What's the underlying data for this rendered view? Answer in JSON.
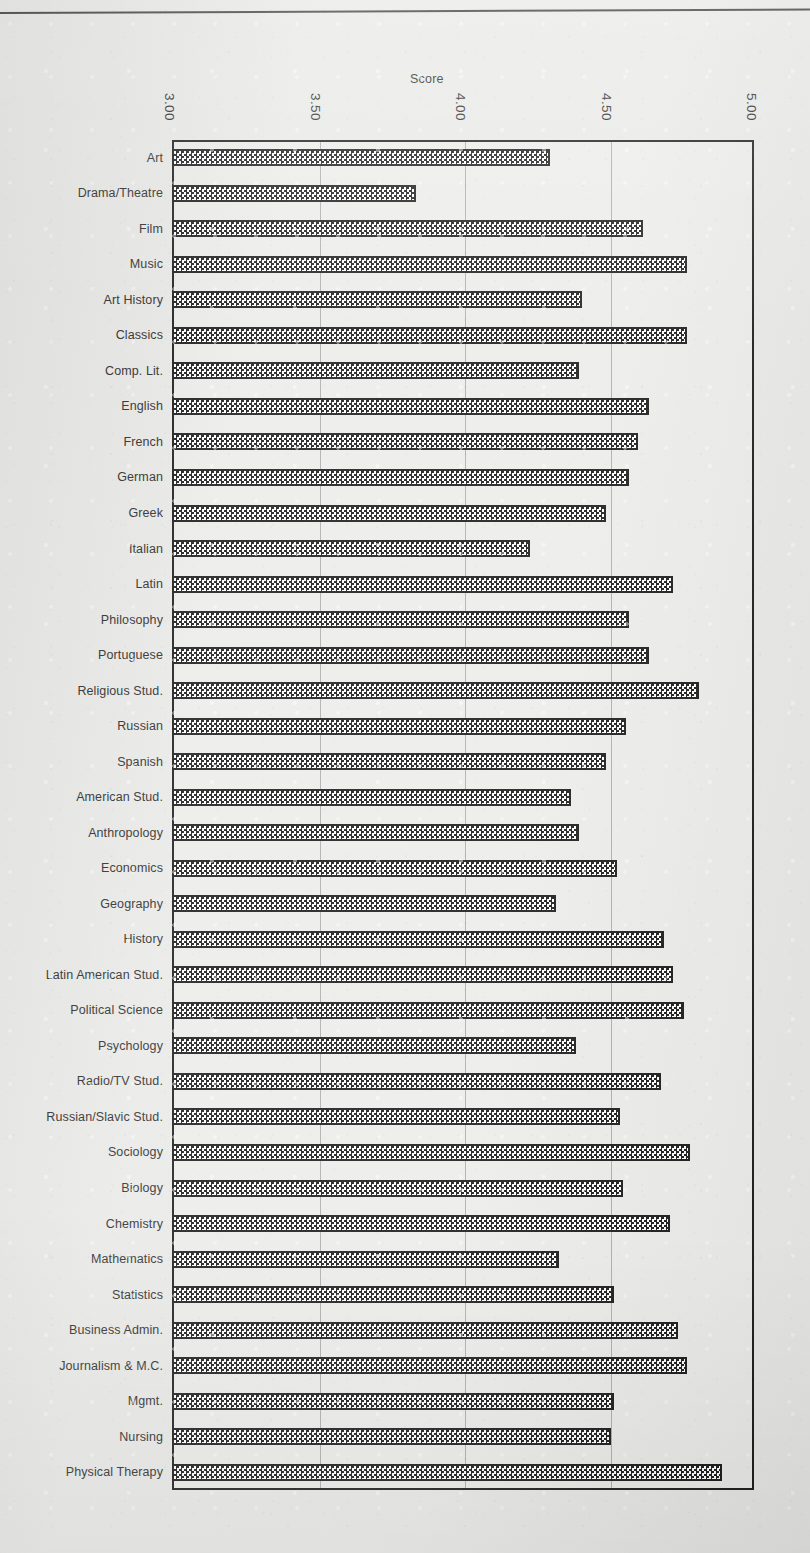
{
  "chart_data": {
    "type": "bar",
    "orientation": "horizontal",
    "title": "",
    "xlabel": "Score",
    "ylabel": "",
    "xlim": [
      3.0,
      5.0
    ],
    "xticks": [
      "3.00",
      "3.50",
      "4.00",
      "4.50",
      "5.00"
    ],
    "xtick_values": [
      3.0,
      3.5,
      4.0,
      4.5,
      5.0
    ],
    "grid": true,
    "gridlines": "vertical",
    "legend": null,
    "categories": [
      "Art",
      "Drama/Theatre",
      "Film",
      "Music",
      "Art History",
      "Classics",
      "Comp. Lit.",
      "English",
      "French",
      "German",
      "Greek",
      "Italian",
      "Latin",
      "Philosophy",
      "Portuguese",
      "Religious Stud.",
      "Russian",
      "Spanish",
      "American Stud.",
      "Anthropology",
      "Economics",
      "Geography",
      "History",
      "Latin American Stud.",
      "Political  Science",
      "Psychology",
      "Radio/TV Stud.",
      "Russian/Slavic Stud.",
      "Sociology",
      "Biology",
      "Chemistry",
      "Mathematics",
      "Statistics",
      "Business Admin.",
      "Journalism & M.C.",
      "Mgmt.",
      "Nursing",
      "Physical Therapy"
    ],
    "values": [
      4.3,
      3.84,
      4.62,
      4.77,
      4.41,
      4.77,
      4.4,
      4.64,
      4.6,
      4.57,
      4.49,
      4.23,
      4.72,
      4.57,
      4.64,
      4.81,
      4.56,
      4.49,
      4.37,
      4.4,
      4.53,
      4.32,
      4.69,
      4.72,
      4.76,
      4.39,
      4.68,
      4.54,
      4.78,
      4.55,
      4.71,
      4.33,
      4.52,
      4.74,
      4.77,
      4.52,
      4.51,
      4.89
    ]
  },
  "axis": {
    "title": "Score"
  },
  "style": {
    "bar_fill": "#1a1a1a",
    "bar_pattern": "checkerboard",
    "frame_color": "#1d1d1d",
    "grid_color": "#9a9a9a",
    "background": "#e9e9e7"
  }
}
